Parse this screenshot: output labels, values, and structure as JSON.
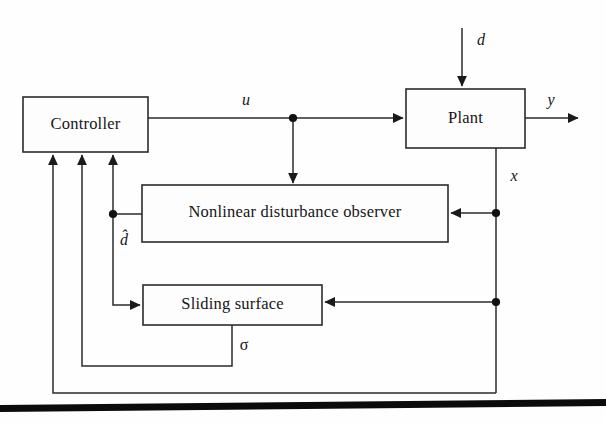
{
  "diagram": {
    "blocks": {
      "controller": {
        "label": "Controller"
      },
      "plant": {
        "label": "Plant"
      },
      "observer": {
        "label": "Nonlinear disturbance observer"
      },
      "sliding_surface": {
        "label": "Sliding surface"
      }
    },
    "signals": {
      "control_input": "u",
      "disturbance": "d",
      "output": "y",
      "state": "x",
      "disturbance_estimate": "d̂",
      "sliding_variable": "σ"
    },
    "colors": {
      "line": "#2b2b2b",
      "text": "#151515",
      "background": "#fefefe",
      "rule": "#0b0b0b"
    }
  }
}
